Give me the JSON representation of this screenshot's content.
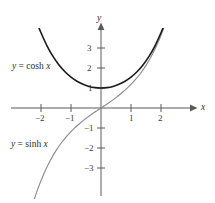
{
  "chart_data": {
    "type": "line",
    "title": "",
    "xlabel": "x",
    "ylabel": "y",
    "xlim": [
      -2.6,
      2.6
    ],
    "ylim": [
      -3.9,
      4.2
    ],
    "xticks": [
      -2,
      -1,
      1,
      2
    ],
    "xtick_labels": [
      "−2",
      "−1",
      "1",
      "2"
    ],
    "yticks": [
      1,
      2,
      3
    ],
    "ytick_labels": [
      "1",
      "2",
      "3"
    ],
    "yticks_negative": [
      -1,
      -2,
      -3
    ],
    "ytick_labels_negative": [
      "−1",
      "−2",
      "−3"
    ],
    "grid": false,
    "legend": "inline-annotations",
    "series": [
      {
        "name": "y = cosh x",
        "color": "#1a1a1a",
        "label_text_prefix": "y",
        "label_text_eq": "=",
        "label_text_fn": "cosh",
        "label_text_var": "x",
        "x": [
          -2.1,
          -2.0,
          -1.8,
          -1.6,
          -1.4,
          -1.2,
          -1.0,
          -0.8,
          -0.6,
          -0.4,
          -0.2,
          0.0,
          0.2,
          0.4,
          0.6,
          0.8,
          1.0,
          1.2,
          1.4,
          1.6,
          1.8,
          2.0,
          2.1
        ],
        "y": [
          4.14,
          3.76,
          3.11,
          2.58,
          2.15,
          1.81,
          1.54,
          1.34,
          1.19,
          1.08,
          1.02,
          1.0,
          1.02,
          1.08,
          1.19,
          1.34,
          1.54,
          1.81,
          2.15,
          2.58,
          3.11,
          3.76,
          4.14
        ]
      },
      {
        "name": "y = sinh x",
        "color": "#8c8c8c",
        "label_text_prefix": "y",
        "label_text_eq": "=",
        "label_text_fn": "sinh",
        "label_text_var": "x",
        "x": [
          -2.5,
          -2.3,
          -2.1,
          -1.9,
          -1.7,
          -1.5,
          -1.3,
          -1.1,
          -0.9,
          -0.7,
          -0.5,
          -0.3,
          -0.1,
          0.0,
          0.1,
          0.3,
          0.5,
          0.7,
          0.9,
          1.1,
          1.3,
          1.5,
          1.7,
          1.9,
          2.1,
          2.2
        ],
        "y": [
          -6.05,
          -4.94,
          -4.02,
          -3.27,
          -2.65,
          -2.13,
          -1.7,
          -1.34,
          -1.03,
          -0.76,
          -0.52,
          -0.3,
          -0.1,
          0.0,
          0.1,
          0.3,
          0.52,
          0.76,
          1.03,
          1.34,
          1.7,
          2.13,
          2.65,
          3.27,
          4.02,
          4.46
        ]
      }
    ]
  },
  "axes": {
    "y_axis_label": "y",
    "x_axis_label": "x",
    "axis_color": "#555555"
  },
  "labels": {
    "cosh_annotation": "y = cosh x",
    "sinh_annotation": "y = sinh x"
  }
}
